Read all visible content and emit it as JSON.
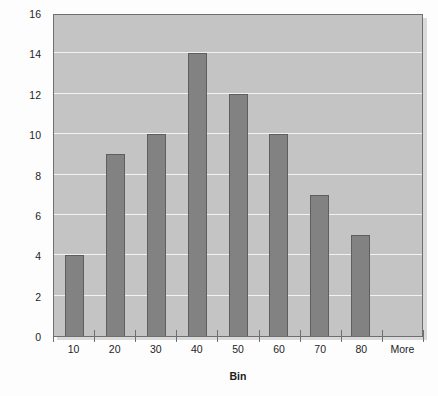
{
  "chart_data": {
    "type": "bar",
    "title": "",
    "subtitle": "",
    "xlabel": "Bin",
    "ylabel": "Frequency",
    "categories": [
      "10",
      "20",
      "30",
      "40",
      "50",
      "60",
      "70",
      "80",
      "More"
    ],
    "values": [
      4,
      9,
      10,
      14,
      12,
      10,
      7,
      5,
      0
    ],
    "series": [
      {
        "name": "Frequency",
        "values": [
          4,
          9,
          10,
          14,
          12,
          10,
          7,
          5,
          0
        ]
      }
    ],
    "ylim": [
      0,
      16
    ],
    "ytick_step": 2,
    "yticks": [
      0,
      2,
      4,
      6,
      8,
      10,
      12,
      14,
      16
    ],
    "ytick_labels": [
      "0",
      "2",
      "4",
      "6",
      "8",
      "10",
      "12",
      "14",
      "16"
    ],
    "grid": true,
    "grid_axis": "y",
    "legend": false,
    "legend_position": "none",
    "annotations": [],
    "colors": {
      "bar_fill": "#828282",
      "bar_border": "#5e5e5e",
      "plot_background": "#c4c4c4",
      "plot_border": "#6f6f6f",
      "gridline": "#f2f2f2",
      "figure_background": "#fdfdfd",
      "text": "#1d1d1d"
    }
  }
}
